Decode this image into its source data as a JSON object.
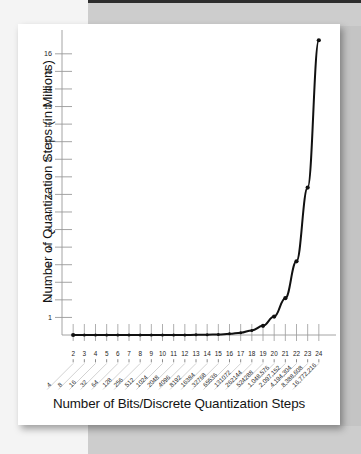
{
  "page": {
    "kind": "scanned-book-figure"
  },
  "chart_data": {
    "type": "line",
    "title": "",
    "xlabel": "Number of Bits/Discrete Quantization Steps",
    "ylabel": "Number of Quantization Steps (in Millions)",
    "xlim": [
      1,
      25
    ],
    "ylim": [
      0,
      16.9
    ],
    "grid": false,
    "legend": null,
    "x_tick_labels": [
      "2",
      "3",
      "4",
      "5",
      "6",
      "7",
      "8",
      "9",
      "10",
      "11",
      "12",
      "13",
      "14",
      "15",
      "16",
      "17",
      "18",
      "19",
      "20",
      "21",
      "22",
      "23",
      "24"
    ],
    "x_step_labels": [
      "4",
      "8",
      "16",
      "32",
      "64",
      "128",
      "256",
      "512",
      "1024",
      "2048",
      "4096",
      "8192",
      "16384",
      "32768",
      "65536",
      "131072",
      "262144",
      "524288",
      "1,048,576",
      "2,097,152",
      "4,194,304",
      "8,388,608",
      "16,772,216"
    ],
    "y_tick_labels": [
      "1",
      "2",
      "3",
      "4",
      "5",
      "6",
      "7",
      "8",
      "9",
      "10",
      "11",
      "12",
      "13",
      "14",
      "15",
      "16"
    ],
    "y_ticks": [
      1,
      2,
      3,
      4,
      5,
      6,
      7,
      8,
      9,
      10,
      11,
      12,
      13,
      14,
      15,
      16
    ],
    "x": [
      2,
      3,
      4,
      5,
      6,
      7,
      8,
      9,
      10,
      11,
      12,
      13,
      14,
      15,
      16,
      17,
      18,
      19,
      20,
      21,
      22,
      23,
      24
    ],
    "values": [
      4e-06,
      8e-06,
      1.6e-05,
      3.2e-05,
      6.4e-05,
      0.000128,
      0.000256,
      0.000512,
      0.001024,
      0.002048,
      0.004096,
      0.008192,
      0.016384,
      0.032768,
      0.065536,
      0.131072,
      0.262144,
      0.524288,
      1.048576,
      2.097152,
      4.194304,
      8.388608,
      16.772216
    ],
    "series": [
      {
        "name": "Quantization steps",
        "values": [
          4e-06,
          8e-06,
          1.6e-05,
          3.2e-05,
          6.4e-05,
          0.000128,
          0.000256,
          0.000512,
          0.001024,
          0.002048,
          0.004096,
          0.008192,
          0.016384,
          0.032768,
          0.065536,
          0.131072,
          0.262144,
          0.524288,
          1.048576,
          2.097152,
          4.194304,
          8.388608,
          16.772216
        ],
        "color": "#111111",
        "marker": "circle"
      }
    ]
  },
  "colors": {
    "line": "#111111",
    "axis": "#9a9a9a",
    "tick": "#9a9a9a",
    "text": "#141414",
    "paper": "#ffffff",
    "backdrop": "#f4f4f4",
    "band": "#cdcdcd"
  }
}
